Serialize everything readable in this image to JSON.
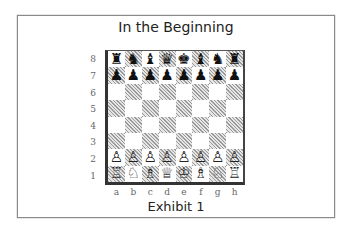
{
  "title": "In the Beginning",
  "caption": "Exhibit 1",
  "board": {
    "ranks": [
      "8",
      "7",
      "6",
      "5",
      "4",
      "3",
      "2",
      "1"
    ],
    "files": [
      "a",
      "b",
      "c",
      "d",
      "e",
      "f",
      "g",
      "h"
    ],
    "position": [
      [
        "r",
        "n",
        "b",
        "q",
        "k",
        "b",
        "n",
        "r"
      ],
      [
        "p",
        "p",
        "p",
        "p",
        "p",
        "p",
        "p",
        "p"
      ],
      [
        "",
        "",
        "",
        "",
        "",
        "",
        "",
        ""
      ],
      [
        "",
        "",
        "",
        "",
        "",
        "",
        "",
        ""
      ],
      [
        "",
        "",
        "",
        "",
        "",
        "",
        "",
        ""
      ],
      [
        "",
        "",
        "",
        "",
        "",
        "",
        "",
        ""
      ],
      [
        "P",
        "P",
        "P",
        "P",
        "P",
        "P",
        "P",
        "P"
      ],
      [
        "R",
        "N",
        "B",
        "Q",
        "K",
        "B",
        "N",
        "R"
      ]
    ],
    "piece_glyphs": {
      "K": "♔",
      "Q": "♕",
      "R": "♖",
      "B": "♗",
      "N": "♘",
      "P": "♙",
      "k": "♚",
      "q": "♛",
      "r": "♜",
      "b": "♝",
      "n": "♞",
      "p": "♟"
    },
    "piece_names": {
      "K": "white-king",
      "Q": "white-queen",
      "R": "white-rook",
      "B": "white-bishop",
      "N": "white-knight",
      "P": "white-pawn",
      "k": "black-king",
      "q": "black-queen",
      "r": "black-rook",
      "b": "black-bishop",
      "n": "black-knight",
      "p": "black-pawn"
    }
  }
}
